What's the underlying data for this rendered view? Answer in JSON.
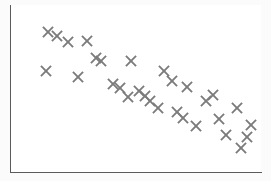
{
  "chart_data": {
    "type": "scatter",
    "title": "",
    "subtitle": "",
    "xlabel": "",
    "ylabel": "",
    "xlim": [
      0,
      100
    ],
    "ylim": [
      0,
      100
    ],
    "grid": false,
    "legend": null,
    "marker": {
      "style": "x",
      "color": "#7b7b7b",
      "size": 13,
      "linewidth": 1.9,
      "name": "x-cross-marker"
    },
    "axes": {
      "spines": [
        "left",
        "bottom"
      ],
      "spine_color": "#5a5a5a",
      "background": "#ffffff",
      "tick_labels_x": [],
      "tick_labels_y": []
    },
    "relationship": "negative",
    "point_count": 30,
    "series": [
      {
        "name": "observations",
        "color": "#7b7b7b",
        "points": [
          {
            "px": 48,
            "py": 32,
            "x": 15.2,
            "y": 84.6
          },
          {
            "px": 68,
            "py": 42,
            "x": 23.2,
            "y": 78.7
          },
          {
            "px": 87,
            "py": 41,
            "x": 30.8,
            "y": 79.3
          },
          {
            "px": 46,
            "py": 71,
            "x": 14.4,
            "y": 61.5
          },
          {
            "px": 78,
            "py": 77,
            "x": 27.2,
            "y": 57.9
          },
          {
            "px": 101,
            "py": 61,
            "x": 36.4,
            "y": 67.5
          },
          {
            "px": 131,
            "py": 61,
            "x": 48.4,
            "y": 67.5
          },
          {
            "px": 164,
            "py": 71,
            "x": 61.6,
            "y": 61.5
          },
          {
            "px": 120,
            "py": 88,
            "x": 44.0,
            "y": 51.5
          },
          {
            "px": 139,
            "py": 91,
            "x": 51.6,
            "y": 49.7
          },
          {
            "px": 150,
            "py": 101,
            "x": 56.0,
            "y": 43.8
          },
          {
            "px": 187,
            "py": 87,
            "x": 70.8,
            "y": 52.1
          },
          {
            "px": 213,
            "py": 95,
            "x": 81.2,
            "y": 47.3
          },
          {
            "px": 177,
            "py": 112,
            "x": 66.8,
            "y": 37.3
          },
          {
            "px": 196,
            "py": 126,
            "x": 74.4,
            "y": 28.9
          },
          {
            "px": 237,
            "py": 108,
            "x": 90.8,
            "y": 39.6
          },
          {
            "px": 251,
            "py": 125,
            "x": 96.4,
            "y": 29.5
          },
          {
            "px": 226,
            "py": 135,
            "x": 86.4,
            "y": 23.7
          },
          {
            "px": 241,
            "py": 148,
            "x": 92.4,
            "y": 15.9
          },
          {
            "px": 57,
            "py": 36,
            "x": 18.8,
            "y": 82.2
          },
          {
            "px": 96,
            "py": 58,
            "x": 34.4,
            "y": 69.2
          },
          {
            "px": 113,
            "py": 84,
            "x": 41.2,
            "y": 53.8
          },
          {
            "px": 145,
            "py": 96,
            "x": 54.0,
            "y": 46.7
          },
          {
            "px": 172,
            "py": 81,
            "x": 64.8,
            "y": 55.6
          },
          {
            "px": 206,
            "py": 101,
            "x": 78.4,
            "y": 43.8
          },
          {
            "px": 219,
            "py": 119,
            "x": 83.6,
            "y": 33.1
          },
          {
            "px": 183,
            "py": 118,
            "x": 69.2,
            "y": 33.7
          },
          {
            "px": 158,
            "py": 108,
            "x": 59.2,
            "y": 39.6
          },
          {
            "px": 128,
            "py": 97,
            "x": 47.2,
            "y": 46.2
          },
          {
            "px": 247,
            "py": 137,
            "x": 94.8,
            "y": 22.5
          }
        ]
      }
    ]
  }
}
